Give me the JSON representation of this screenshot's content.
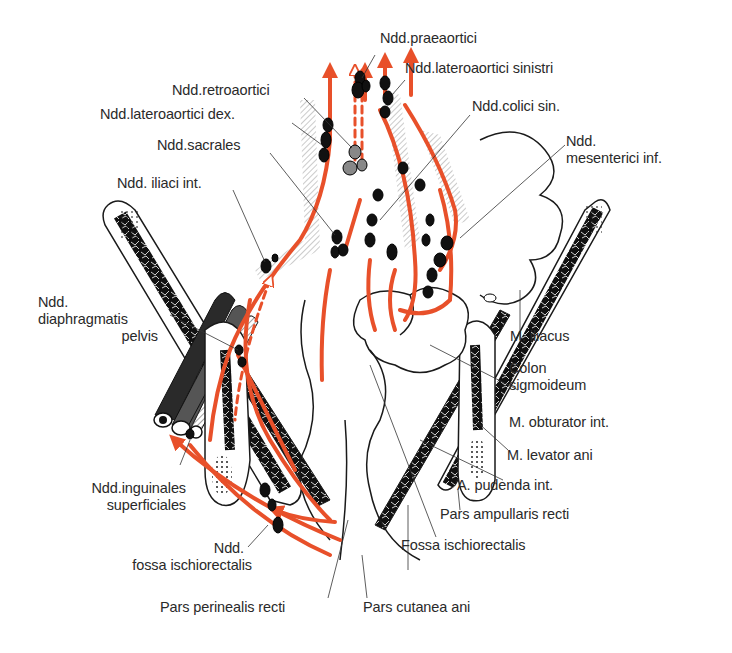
{
  "figure": {
    "type": "anatomical illustration",
    "colors": {
      "lymph_vessel": "#e8502a",
      "outline": "#1a1a1a",
      "label_text": "#2a2a2a",
      "background": "#ffffff"
    }
  },
  "labels": {
    "praeaortici": "Ndd.praeaortici",
    "lateroaortici_sinistri": "Ndd.lateroaortici sinistri",
    "retroaortici": "Ndd.retroaortici",
    "lateroaortici_dex": "Ndd.lateroaortici dex.",
    "colici_sin": "Ndd.colici sin.",
    "sacrales": "Ndd.sacrales",
    "mesenterici_inf_1": "Ndd.",
    "mesenterici_inf_2": "mesenterici inf.",
    "iliaci_int": "Ndd. iliaci int.",
    "diaphragmatis_1": "Ndd.",
    "diaphragmatis_2": "diaphragmatis",
    "diaphragmatis_3": "pelvis",
    "m_iliacus": "M. iliacus",
    "colon_1": "Colon",
    "colon_2": "sigmoideum",
    "m_obturator": "M. obturator int.",
    "inguinales_1": "Ndd.inguinales",
    "inguinales_2": "superficiales",
    "m_levator": "M. levator ani",
    "a_pudenda": "A. pudenda int.",
    "fossa_nodes_1": "Ndd.",
    "fossa_nodes_2": "fossa ischiorectalis",
    "pars_ampullaris": "Pars ampullaris recti",
    "fossa_ischiorectalis": "Fossa ischiorectalis",
    "pars_perinealis": "Pars perinealis recti",
    "pars_cutanea": "Pars cutanea ani"
  }
}
